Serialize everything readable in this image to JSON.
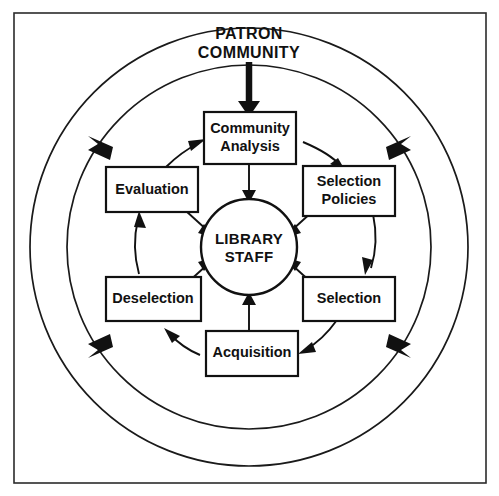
{
  "diagram": {
    "title_lines": [
      "PATRON",
      "COMMUNITY"
    ],
    "center": {
      "line1": "LIBRARY",
      "line2": "STAFF"
    },
    "nodes": [
      {
        "id": "community-analysis",
        "line1": "Community",
        "line2": "Analysis"
      },
      {
        "id": "selection-policies",
        "line1": "Selection",
        "line2": "Policies"
      },
      {
        "id": "selection",
        "line1": "Selection",
        "line2": ""
      },
      {
        "id": "acquisition",
        "line1": "Acquisition",
        "line2": ""
      },
      {
        "id": "deselection",
        "line1": "Deselection",
        "line2": ""
      },
      {
        "id": "evaluation",
        "line1": "Evaluation",
        "line2": ""
      }
    ],
    "colors": {
      "stroke": "#111111",
      "frame": "#2b2b2b",
      "background": "#ffffff"
    }
  }
}
